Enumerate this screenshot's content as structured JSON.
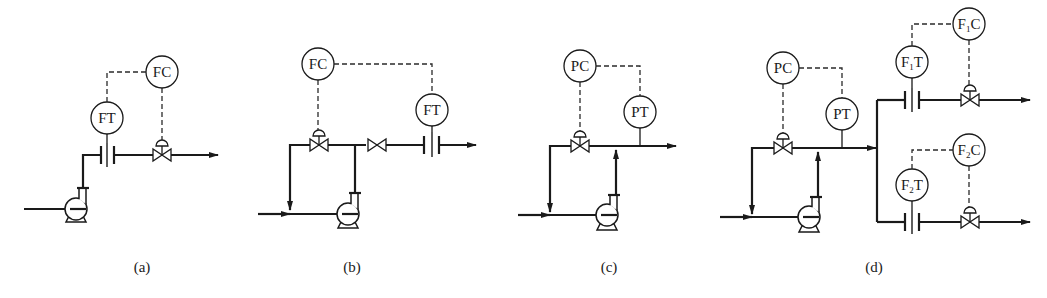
{
  "figure": {
    "panels": [
      {
        "id": "a",
        "caption": "(a)",
        "instruments": [
          {
            "tag": "FT",
            "label": "FT",
            "role": "flow transmitter"
          },
          {
            "tag": "FC",
            "label": "FC",
            "role": "flow controller"
          }
        ],
        "equipment": [
          "pump",
          "orifice-plate",
          "control-valve"
        ]
      },
      {
        "id": "b",
        "caption": "(b)",
        "instruments": [
          {
            "tag": "FC",
            "label": "FC",
            "role": "flow controller"
          },
          {
            "tag": "FT",
            "label": "FT",
            "role": "flow transmitter"
          }
        ],
        "equipment": [
          "pump",
          "bypass-control-valve",
          "hand-valve",
          "orifice-plate"
        ]
      },
      {
        "id": "c",
        "caption": "(c)",
        "instruments": [
          {
            "tag": "PC",
            "label": "PC",
            "role": "pressure controller"
          },
          {
            "tag": "PT",
            "label": "PT",
            "role": "pressure transmitter"
          }
        ],
        "equipment": [
          "pump",
          "bypass-control-valve"
        ]
      },
      {
        "id": "d",
        "caption": "(d)",
        "instruments": [
          {
            "tag": "PC",
            "label": "PC",
            "role": "pressure controller"
          },
          {
            "tag": "PT",
            "label": "PT",
            "role": "pressure transmitter"
          },
          {
            "tag": "F1T",
            "label_main": "F",
            "label_sub": "1",
            "label_end": "T",
            "role": "flow transmitter 1"
          },
          {
            "tag": "F1C",
            "label_main": "F",
            "label_sub": "1",
            "label_end": "C",
            "role": "flow controller 1"
          },
          {
            "tag": "F2T",
            "label_main": "F",
            "label_sub": "2",
            "label_end": "T",
            "role": "flow transmitter 2"
          },
          {
            "tag": "F2C",
            "label_main": "F",
            "label_sub": "2",
            "label_end": "C",
            "role": "flow controller 2"
          }
        ],
        "equipment": [
          "pump",
          "bypass-control-valve",
          "orifice-plate-1",
          "control-valve-1",
          "orifice-plate-2",
          "control-valve-2"
        ]
      }
    ]
  }
}
